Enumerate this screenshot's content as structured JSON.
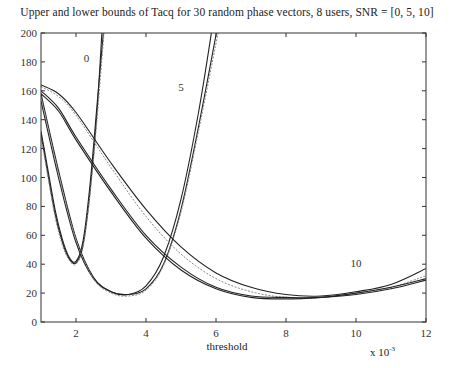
{
  "chart_data": {
    "type": "line",
    "title": "Upper and lower bounds of Tacq for 30 random phase vectors, 8 users, SNR = [0, 5, 10]",
    "xlabel": "threshold",
    "ylabel": "",
    "x_multiplier": "x 10",
    "x_multiplier_exp": "-3",
    "xlim": [
      1,
      12
    ],
    "ylim": [
      0,
      200
    ],
    "xticks": [
      2,
      4,
      6,
      8,
      10,
      12
    ],
    "yticks": [
      0,
      20,
      40,
      60,
      80,
      100,
      120,
      140,
      160,
      180,
      200
    ],
    "grid": false,
    "legend": "none (curves annotated inline)",
    "annotations": [
      {
        "text": "0",
        "x": 2.3,
        "y": 180
      },
      {
        "text": "5",
        "x": 5.0,
        "y": 160
      },
      {
        "text": "10",
        "x": 10.0,
        "y": 38
      }
    ],
    "series": [
      {
        "name": "SNR=0 bound A",
        "group": "0",
        "style": "solid",
        "x": [
          1,
          1.2,
          1.4,
          1.6,
          1.8,
          2.0,
          2.2,
          2.4,
          2.6,
          2.8
        ],
        "y": [
          132,
          105,
          78,
          58,
          45,
          42,
          56,
          95,
          150,
          205
        ]
      },
      {
        "name": "SNR=0 bound B",
        "group": "0",
        "style": "solid",
        "x": [
          1,
          1.2,
          1.4,
          1.6,
          1.8,
          2.0,
          2.2,
          2.4,
          2.6,
          2.75
        ],
        "y": [
          130,
          102,
          75,
          56,
          44,
          41,
          53,
          90,
          145,
          205
        ]
      },
      {
        "name": "SNR=0 bound C",
        "group": "0",
        "style": "dashed",
        "x": [
          1,
          1.2,
          1.4,
          1.6,
          1.8,
          2.0,
          2.2,
          2.4,
          2.6,
          2.8
        ],
        "y": [
          128,
          100,
          73,
          54,
          43,
          40,
          52,
          88,
          140,
          200
        ]
      },
      {
        "name": "SNR=5 bound A",
        "group": "5",
        "style": "solid",
        "x": [
          1,
          1.5,
          2,
          2.5,
          3,
          3.5,
          4,
          4.5,
          5,
          5.5,
          5.9
        ],
        "y": [
          153,
          100,
          55,
          30,
          21,
          19,
          25,
          45,
          85,
          145,
          205
        ]
      },
      {
        "name": "SNR=5 bound B",
        "group": "5",
        "style": "solid",
        "x": [
          1,
          1.5,
          2,
          2.5,
          3,
          3.5,
          4,
          4.5,
          5,
          5.5,
          6.05
        ],
        "y": [
          158,
          105,
          58,
          31,
          21,
          19,
          23,
          40,
          78,
          135,
          205
        ]
      },
      {
        "name": "SNR=5 bound C",
        "group": "5",
        "style": "dashed",
        "x": [
          1,
          1.5,
          2,
          2.5,
          3,
          3.5,
          4,
          4.5,
          5,
          5.5,
          6.1
        ],
        "y": [
          156,
          103,
          57,
          30,
          20,
          18,
          22,
          39,
          76,
          132,
          205
        ]
      },
      {
        "name": "SNR=10 bound A",
        "group": "10",
        "style": "solid",
        "x": [
          1,
          1.5,
          2,
          3,
          4,
          5,
          6,
          7,
          8,
          9,
          10,
          11,
          12
        ],
        "y": [
          164,
          158,
          145,
          110,
          78,
          52,
          34,
          24,
          19,
          18,
          21,
          26,
          37
        ]
      },
      {
        "name": "SNR=10 bound B",
        "group": "10",
        "style": "dashed",
        "x": [
          1,
          1.5,
          2,
          3,
          4,
          5,
          6,
          7,
          8,
          9,
          10,
          11,
          12
        ],
        "y": [
          163,
          156,
          143,
          107,
          73,
          47,
          30,
          21,
          17,
          17,
          20,
          24,
          32
        ]
      },
      {
        "name": "SNR=10 bound C",
        "group": "10",
        "style": "solid",
        "x": [
          1,
          1.5,
          2,
          3,
          4,
          5,
          6,
          7,
          8,
          9,
          10,
          11,
          12
        ],
        "y": [
          160,
          148,
          128,
          92,
          60,
          38,
          24,
          18,
          17,
          17,
          20,
          24,
          30
        ]
      },
      {
        "name": "SNR=10 bound D",
        "group": "10",
        "style": "solid",
        "x": [
          1,
          1.5,
          2,
          3,
          4,
          5,
          6,
          7,
          8,
          9,
          10,
          11,
          12
        ],
        "y": [
          158,
          146,
          126,
          90,
          58,
          36,
          23,
          17,
          16,
          17,
          19,
          23,
          29
        ]
      }
    ]
  }
}
